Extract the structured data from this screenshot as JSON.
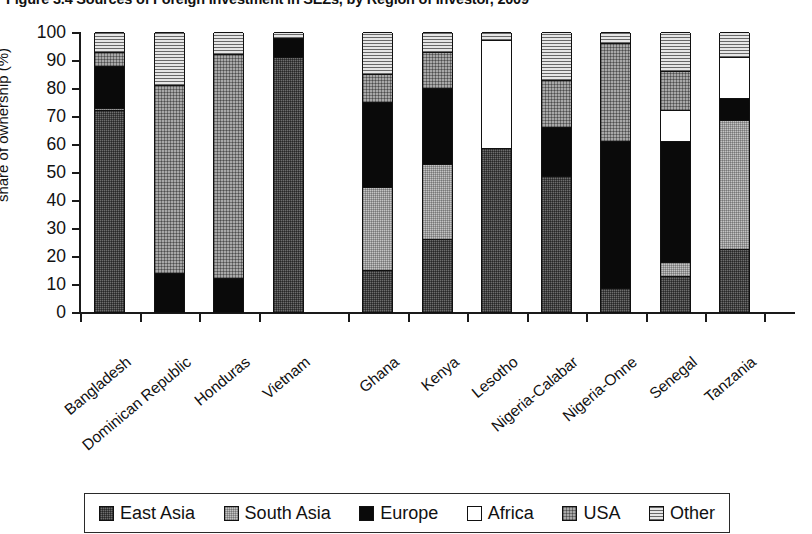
{
  "title": "Figure 3.4   Sources of Foreign Investment in SEZs, by Region of Investor, 2009",
  "axes": {
    "y_title": "share of ownership (%)",
    "y_ticks": [
      "100",
      "90",
      "80",
      "70",
      "60",
      "50",
      "40",
      "30",
      "20",
      "10",
      "0"
    ],
    "y_min": 0,
    "y_max": 100
  },
  "legend": {
    "items": [
      {
        "label": "East Asia",
        "key": "east_asia",
        "swatch": "dark-gray-crosshatch",
        "color": "#6e6e6e"
      },
      {
        "label": "South Asia",
        "key": "south_asia",
        "swatch": "light-gray-crosshatch",
        "color": "#c4c4c4"
      },
      {
        "label": "Europe",
        "key": "europe",
        "swatch": "solid-black",
        "color": "#0a0a0a"
      },
      {
        "label": "Africa",
        "key": "africa",
        "swatch": "white-empty",
        "color": "#ffffff"
      },
      {
        "label": "USA",
        "key": "usa",
        "swatch": "mid-gray-crosshatch",
        "color": "#a8a8a8"
      },
      {
        "label": "Other",
        "key": "other",
        "swatch": "horizontal-stripes",
        "color": "#e6e6e6"
      }
    ]
  },
  "chart_data": {
    "type": "bar",
    "stacked": true,
    "title": "Figure 3.4   Sources of Foreign Investment in SEZs, by Region of Investor, 2009",
    "xlabel": "",
    "ylabel": "share of ownership (%)",
    "ylim": [
      0,
      100
    ],
    "grid": false,
    "legend_position": "bottom",
    "categories": [
      "Bangladesh",
      "Dominican Republic",
      "Honduras",
      "Vietnam",
      "Ghana",
      "Kenya",
      "Lesotho",
      "Nigeria-Calabar",
      "Nigeria-Onne",
      "Senegal",
      "Tanzania"
    ],
    "category_gap_after": "Vietnam",
    "series": [
      {
        "name": "East Asia",
        "values": [
          72,
          0,
          0,
          91,
          15,
          26,
          58.5,
          48.5,
          8.5,
          13,
          22.5
        ]
      },
      {
        "name": "South Asia",
        "values": [
          1,
          0,
          0,
          0,
          29.5,
          27,
          0,
          0,
          0,
          5,
          46
        ]
      },
      {
        "name": "Europe",
        "values": [
          15,
          14,
          12,
          7,
          30.5,
          27,
          0,
          17.5,
          52.5,
          43,
          8
        ]
      },
      {
        "name": "Africa",
        "values": [
          0,
          0,
          0,
          0,
          0,
          0,
          38.5,
          0,
          0,
          11,
          14.5
        ]
      },
      {
        "name": "USA",
        "values": [
          5,
          67,
          80,
          0,
          10,
          13,
          0,
          17,
          35,
          14,
          0
        ]
      },
      {
        "name": "Other",
        "values": [
          7,
          19,
          8,
          2,
          15,
          7,
          3,
          17,
          4,
          14,
          9
        ]
      }
    ]
  }
}
